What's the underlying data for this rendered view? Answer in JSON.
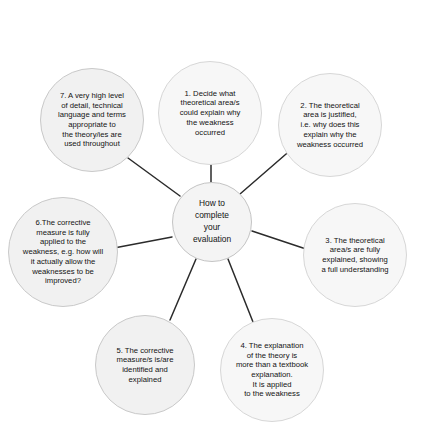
{
  "diagram": {
    "type": "radial-mind-map",
    "background_color": "#ffffff",
    "node_fill_color": "#f1f1f1",
    "node_border_color": "#c9c9c9",
    "connector_color": "#2b2b2b",
    "text_color": "#131313",
    "hub": {
      "label": "How to\ncomplete\nyour\nevaluation"
    },
    "nodes": [
      {
        "id": 1,
        "label": "1. Decide what\ntheoretical area/s\ncould explain why\nthe weakness\noccurred"
      },
      {
        "id": 2,
        "label": "2. The theoretical\narea is justified,\ni.e. why does this\nexplain why the\nweakness occurred"
      },
      {
        "id": 3,
        "label": "3. The theoretical\narea/s are fully\nexplained, showing\na full understanding"
      },
      {
        "id": 4,
        "label": "4. The explanation\nof the theory is\nmore than a textbook\nexplanation.\nIt is applied\nto the weakness"
      },
      {
        "id": 5,
        "label": "5. The corrective\nmeasure/s is/are\nidentified and\nexplained"
      },
      {
        "id": 6,
        "label": "6.The corrective\nmeasure is fully\napplied to the\nweakness, e.g. how will\nit actually allow the\nweaknesses to be\nimproved?"
      },
      {
        "id": 7,
        "label": "7. A very high level\nof detail, technical\nlanguage and terms\nappropriate to\nthe theory/ies are\nused throughout"
      }
    ],
    "connectors": [
      {
        "from": "hub",
        "to": 1
      },
      {
        "from": "hub",
        "to": 2
      },
      {
        "from": "hub",
        "to": 3
      },
      {
        "from": "hub",
        "to": 4
      },
      {
        "from": "hub",
        "to": 5
      },
      {
        "from": "hub",
        "to": 6
      },
      {
        "from": "hub",
        "to": 7
      }
    ]
  }
}
